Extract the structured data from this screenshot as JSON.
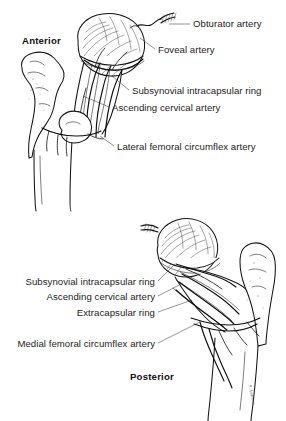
{
  "figure": {
    "background_color": "#ffffff",
    "text_color": "#1d1d1d",
    "line_color": "#141414",
    "width": 286,
    "height": 421
  },
  "panels": [
    {
      "id": "anterior",
      "orientation_label": "Anterior",
      "orientation_label_position": {
        "x": 22,
        "y": 44
      },
      "labels": [
        {
          "id": "obturator-artery",
          "text": "Obturator artery",
          "x": 193,
          "y": 27,
          "anchor": "start",
          "leader": {
            "x1": 190,
            "y1": 24,
            "x2": 169,
            "y2": 24
          }
        },
        {
          "id": "foveal-artery",
          "text": "Foveal artery",
          "x": 158,
          "y": 53,
          "anchor": "start",
          "leader": {
            "x1": 155,
            "y1": 49,
            "x2": 140,
            "y2": 38
          }
        },
        {
          "id": "subsynovial-intracapsular-ring",
          "text": "Subsynovial intracapsular ring",
          "x": 132,
          "y": 94,
          "anchor": "start",
          "leader": {
            "x1": 129,
            "y1": 90,
            "x2": 112,
            "y2": 76
          }
        },
        {
          "id": "ascending-cervical-artery",
          "text": "Ascending cervical artery",
          "x": 112,
          "y": 111,
          "anchor": "start",
          "leader": {
            "x1": 109,
            "y1": 107,
            "x2": 83,
            "y2": 96
          }
        },
        {
          "id": "lateral-femoral-circumflex-artery",
          "text": "Lateral femoral circumflex artery",
          "x": 117,
          "y": 150,
          "anchor": "start",
          "leader": {
            "x1": 114,
            "y1": 146,
            "x2": 100,
            "y2": 136
          }
        }
      ]
    },
    {
      "id": "posterior",
      "orientation_label": "Posterior",
      "orientation_label_position": {
        "x": 130,
        "y": 380
      },
      "labels": [
        {
          "id": "subsynovial-intracapsular-ring-2",
          "text": "Subsynovial intracapsular ring",
          "x": 155,
          "y": 285,
          "anchor": "end",
          "leader": {
            "x1": 158,
            "y1": 281,
            "x2": 175,
            "y2": 264
          }
        },
        {
          "id": "ascending-cervical-artery-2",
          "text": "Ascending cervical artery",
          "x": 155,
          "y": 300,
          "anchor": "end",
          "leader": {
            "x1": 158,
            "y1": 296,
            "x2": 183,
            "y2": 283
          }
        },
        {
          "id": "extracapsular-ring",
          "text": "Extracapsular ring",
          "x": 155,
          "y": 316,
          "anchor": "end",
          "leader": {
            "x1": 158,
            "y1": 312,
            "x2": 192,
            "y2": 300
          }
        },
        {
          "id": "medial-femoral-circumflex-artery",
          "text": "Medial femoral circumflex artery",
          "x": 155,
          "y": 347,
          "anchor": "end",
          "leader": {
            "x1": 158,
            "y1": 343,
            "x2": 200,
            "y2": 322
          }
        }
      ]
    }
  ],
  "artist_signature": "R. Anderson"
}
